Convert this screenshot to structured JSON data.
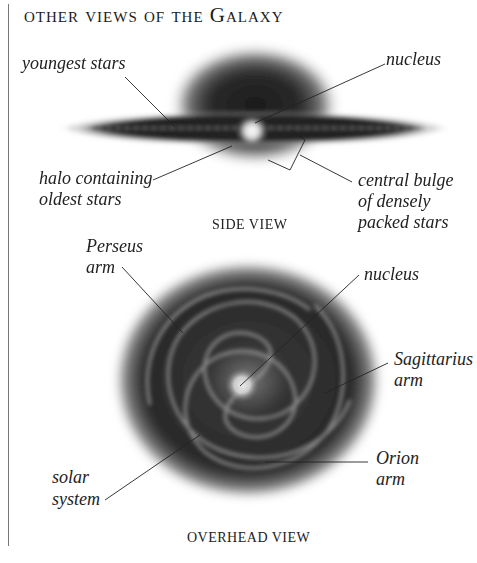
{
  "title": "other views of the Galaxy",
  "side_view": {
    "caption": "SIDE VIEW",
    "labels": {
      "youngest_stars": "youngest stars",
      "nucleus": "nucleus",
      "halo_line1": "halo containing",
      "halo_line2": "oldest stars",
      "bulge_line1": "central bulge",
      "bulge_line2": "of densely",
      "bulge_line3": "packed stars"
    }
  },
  "overhead_view": {
    "caption": "OVERHEAD VIEW",
    "labels": {
      "perseus_line1": "Perseus",
      "perseus_line2": "arm",
      "nucleus": "nucleus",
      "sagittarius_line1": "Sagittarius",
      "sagittarius_line2": "arm",
      "solar_line1": "solar",
      "solar_line2": "system",
      "orion_line1": "Orion",
      "orion_line2": "arm"
    }
  },
  "colors": {
    "ink": "#1a1a1a",
    "rule": "#777777",
    "background": "#ffffff"
  }
}
